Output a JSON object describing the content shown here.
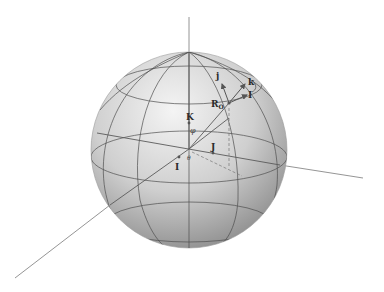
{
  "diagram": {
    "type": "sphere-coordinate-frame",
    "colors": {
      "sphere_light": "#f2f2f2",
      "sphere_dark": "#8e8e8e",
      "grid": "#4a4a4a",
      "axis": "#6a6a6a",
      "vector": "#555555",
      "label": "#2a2a2a"
    },
    "labels": {
      "global_x": "I",
      "global_y": "J",
      "global_z": "K",
      "position": "R",
      "position_sub": "O",
      "local_i": "I",
      "local_j": "j",
      "local_k": "k",
      "polar_angle": "φ",
      "azimuth_angle": "θ"
    }
  }
}
